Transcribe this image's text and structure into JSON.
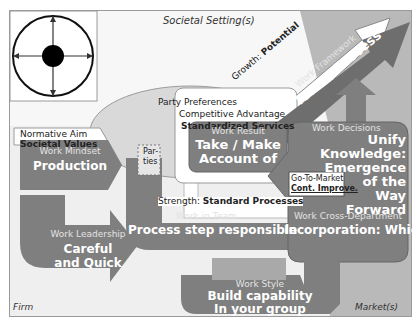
{
  "colors": {
    "background": "#efefef",
    "societal_band": "#f7f7f7",
    "market_band": "#b4b4b4",
    "arrow_gray": "#7f7f7f",
    "dark_arrow": "#6e6e6e",
    "ellipse": "#d9d9d9",
    "white_box": "#ffffff",
    "frame": "#9a9a9a"
  },
  "compass": {
    "icon": "compass-crosshair-icon"
  },
  "labels": {
    "societal_setting": "Societal Setting(s)",
    "firm": "Firm",
    "markets": "Market(s)",
    "party_preferences": "Party Preferences",
    "parties": [
      "Par-",
      "ties"
    ]
  },
  "normative_aim": {
    "title": "Normative Aim",
    "value": "Societal Values"
  },
  "competitive_advantage": {
    "title": "Competitive Advantage",
    "value": "Standardized Services"
  },
  "growth": {
    "prefix": "Growth: ",
    "value": "Potential"
  },
  "work_framework": {
    "title": "Work Framework",
    "value": "Team / Process"
  },
  "work_mindset": {
    "title": "Work Mindset",
    "value": "Production"
  },
  "work_result": {
    "title": "Work Result",
    "lines": [
      "Take / Make",
      "Account of"
    ]
  },
  "work_decisions": {
    "title": "Work Decisions",
    "lines": [
      "Unify",
      "Knowledge:",
      "Emergence",
      "of the",
      "Way",
      "Forward"
    ]
  },
  "go_to_market": {
    "title": "Go-To-Market",
    "value": "Cont. Improve."
  },
  "strength": {
    "prefix": "Strength: ",
    "value": "Standard Processes"
  },
  "work_in_team": {
    "title": "Work in Team",
    "value": "Process step responsible"
  },
  "work_leadership": {
    "title": "Work Leadership",
    "lines": [
      "Careful",
      "and Quick"
    ]
  },
  "work_cross_department": {
    "title": "Work Cross-Department",
    "value": "Incorporation: Which"
  },
  "work_style": {
    "title": "Work Style",
    "lines": [
      "Build capability",
      "In your group"
    ]
  }
}
